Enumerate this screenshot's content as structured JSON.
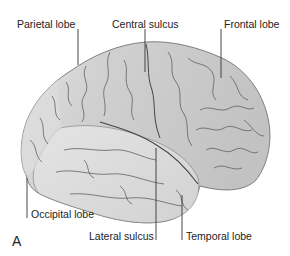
{
  "figure": {
    "panel_letter": "A",
    "labels": {
      "parietal_lobe": "Parietal lobe",
      "central_sulcus": "Central sulcus",
      "frontal_lobe": "Frontal lobe",
      "occipital_lobe": "Occipital lobe",
      "lateral_sulcus": "Lateral sulcus",
      "temporal_lobe": "Temporal lobe"
    },
    "colors": {
      "background": "#ffffff",
      "brain_fill": "#c9c9c9",
      "brain_light": "#dedede",
      "sulcus_line": "#555555",
      "leader_line": "#333333",
      "text": "#222222"
    }
  }
}
